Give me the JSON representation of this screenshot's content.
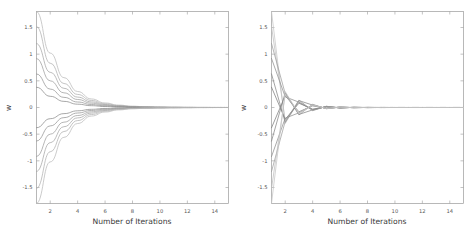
{
  "figure": {
    "background_color": "#ffffff",
    "frame_color": "#9a9a9a",
    "text_color": "#555555"
  },
  "chart_data": [
    {
      "type": "line",
      "title": "",
      "panel_name": "monotonic-convergence",
      "xlabel": "Number of Iterations",
      "ylabel": "w",
      "xlim": [
        1,
        15
      ],
      "ylim": [
        -1.8,
        1.8
      ],
      "xticks": [
        2,
        4,
        6,
        8,
        10,
        12,
        14
      ],
      "xticklabels": [
        "2",
        "4",
        "6",
        "8",
        "10",
        "12",
        "14"
      ],
      "yticks": [
        1.5,
        1,
        0.5,
        0,
        -0.5,
        -1,
        -1.5
      ],
      "yticklabels": [
        "1.5",
        "1",
        "0.5",
        "0",
        "-0.5",
        "-1",
        "-1.5"
      ],
      "grid": false,
      "legend": null,
      "x": [
        1,
        2,
        3,
        4,
        5,
        6,
        7,
        8,
        9,
        10,
        11,
        12,
        13,
        14,
        15
      ],
      "series": [
        {
          "name": "w1",
          "color": "#b9b9b9",
          "values": [
            1.8,
            1.02,
            0.56,
            0.3,
            0.16,
            0.085,
            0.045,
            0.024,
            0.013,
            0.007,
            0.004,
            0.002,
            0.001,
            0.0005,
            0.0003
          ]
        },
        {
          "name": "w2",
          "color": "#b0b0b0",
          "values": [
            1.52,
            0.83,
            0.45,
            0.245,
            0.132,
            0.07,
            0.037,
            0.02,
            0.011,
            0.006,
            0.003,
            0.0017,
            0.0009,
            0.0005,
            0.0002
          ]
        },
        {
          "name": "w3",
          "color": "#a6a6a6",
          "values": [
            1.2,
            0.66,
            0.36,
            0.195,
            0.105,
            0.056,
            0.03,
            0.016,
            0.0085,
            0.0045,
            0.0024,
            0.0013,
            0.0007,
            0.0004,
            0.0002
          ]
        },
        {
          "name": "w4",
          "color": "#9d9d9d",
          "values": [
            0.92,
            0.5,
            0.275,
            0.15,
            0.081,
            0.043,
            0.023,
            0.012,
            0.0065,
            0.0035,
            0.0019,
            0.001,
            0.0005,
            0.0003,
            0.0001
          ]
        },
        {
          "name": "w5",
          "color": "#949494",
          "values": [
            0.63,
            0.345,
            0.19,
            0.103,
            0.056,
            0.03,
            0.016,
            0.0085,
            0.0045,
            0.0024,
            0.0013,
            0.0007,
            0.0004,
            0.0002,
            0.0001
          ]
        },
        {
          "name": "w6",
          "color": "#8b8b8b",
          "values": [
            0.38,
            0.21,
            0.115,
            0.062,
            0.034,
            0.018,
            0.0096,
            0.0051,
            0.0027,
            0.0015,
            0.0008,
            0.0004,
            0.0002,
            0.0001,
            5e-05
          ]
        },
        {
          "name": "w7",
          "color": "#8b8b8b",
          "values": [
            -0.38,
            -0.21,
            -0.115,
            -0.062,
            -0.034,
            -0.018,
            -0.0096,
            -0.0051,
            -0.0027,
            -0.0015,
            -0.0008,
            -0.0004,
            -0.0002,
            -0.0001,
            -5e-05
          ]
        },
        {
          "name": "w8",
          "color": "#949494",
          "values": [
            -0.63,
            -0.345,
            -0.19,
            -0.103,
            -0.056,
            -0.03,
            -0.016,
            -0.0085,
            -0.0045,
            -0.0024,
            -0.0013,
            -0.0007,
            -0.0004,
            -0.0002,
            -0.0001
          ]
        },
        {
          "name": "w9",
          "color": "#9d9d9d",
          "values": [
            -0.92,
            -0.5,
            -0.275,
            -0.15,
            -0.081,
            -0.043,
            -0.023,
            -0.012,
            -0.0065,
            -0.0035,
            -0.0019,
            -0.001,
            -0.0005,
            -0.0003,
            -0.0001
          ]
        },
        {
          "name": "w10",
          "color": "#a6a6a6",
          "values": [
            -1.2,
            -0.66,
            -0.36,
            -0.195,
            -0.105,
            -0.056,
            -0.03,
            -0.016,
            -0.0085,
            -0.0045,
            -0.0024,
            -0.0013,
            -0.0007,
            -0.0004,
            -0.0002
          ]
        },
        {
          "name": "w11",
          "color": "#b0b0b0",
          "values": [
            -1.52,
            -0.83,
            -0.45,
            -0.245,
            -0.132,
            -0.07,
            -0.037,
            -0.02,
            -0.011,
            -0.006,
            -0.003,
            -0.0017,
            -0.0009,
            -0.0005,
            -0.0002
          ]
        },
        {
          "name": "w12",
          "color": "#b9b9b9",
          "values": [
            -1.8,
            -1.02,
            -0.56,
            -0.3,
            -0.16,
            -0.085,
            -0.045,
            -0.024,
            -0.013,
            -0.007,
            -0.004,
            -0.002,
            -0.001,
            -0.0005,
            -0.0003
          ]
        }
      ]
    },
    {
      "type": "line",
      "title": "",
      "panel_name": "oscillatory-convergence",
      "xlabel": "Number of Iterations",
      "ylabel": "w",
      "xlim": [
        1,
        15
      ],
      "ylim": [
        -1.8,
        1.8
      ],
      "xticks": [
        2,
        4,
        6,
        8,
        10,
        12,
        14
      ],
      "xticklabels": [
        "2",
        "4",
        "6",
        "8",
        "10",
        "12",
        "14"
      ],
      "yticks": [
        1.5,
        1,
        0.5,
        0,
        -0.5,
        -1,
        -1.5
      ],
      "yticklabels": [
        "1.5",
        "1",
        "0.5",
        "0",
        "-0.5",
        "-1",
        "-1.5"
      ],
      "grid": false,
      "legend": null,
      "x": [
        1,
        2,
        3,
        4,
        5,
        6,
        7,
        8,
        9,
        10,
        11,
        12,
        13,
        14,
        15
      ],
      "series": [
        {
          "name": "w1",
          "color": "#c6c6c6",
          "values": [
            1.8,
            -0.3,
            0.12,
            -0.05,
            0.02,
            -0.008,
            0.003,
            -0.0012,
            0.0005,
            -0.0002,
            0.0001,
            -4e-05,
            2e-05,
            -1e-05,
            3e-06
          ]
        },
        {
          "name": "w2",
          "color": "#bdbdbd",
          "values": [
            1.52,
            -0.24,
            0.095,
            -0.038,
            0.015,
            -0.006,
            0.0024,
            -0.001,
            0.0004,
            -0.00016,
            6e-05,
            -3e-05,
            1e-05,
            -5e-06,
            2e-06
          ]
        },
        {
          "name": "w3",
          "color": "#9e9e9e",
          "values": [
            1.2,
            0.26,
            -0.14,
            0.06,
            -0.024,
            0.0095,
            -0.0038,
            0.0015,
            -0.0006,
            0.00024,
            -0.0001,
            4e-05,
            -1.5e-05,
            6e-06,
            -2e-06
          ]
        },
        {
          "name": "w4",
          "color": "#8f8f8f",
          "values": [
            0.92,
            0.2,
            0.1,
            -0.05,
            0.02,
            -0.008,
            0.0032,
            -0.0013,
            0.0005,
            -0.0002,
            8e-05,
            -3e-05,
            1e-05,
            -5e-06,
            2e-06
          ]
        },
        {
          "name": "w5",
          "color": "#868686",
          "values": [
            0.63,
            -0.28,
            0.13,
            0.045,
            -0.018,
            0.007,
            -0.003,
            0.0012,
            -0.0005,
            0.0002,
            -8e-05,
            3e-05,
            -1e-05,
            4e-06,
            -2e-06
          ]
        },
        {
          "name": "w6",
          "color": "#7d7d7d",
          "values": [
            0.38,
            -0.22,
            0.08,
            -0.03,
            0.012,
            -0.005,
            0.002,
            -0.0008,
            0.0003,
            -0.00012,
            5e-05,
            -2e-05,
            8e-06,
            -3e-06,
            1e-06
          ]
        },
        {
          "name": "w7",
          "color": "#7d7d7d",
          "values": [
            -0.38,
            0.22,
            -0.08,
            0.03,
            -0.012,
            0.005,
            -0.002,
            0.0008,
            -0.0003,
            0.00012,
            -5e-05,
            2e-05,
            -8e-06,
            3e-06,
            -1e-06
          ]
        },
        {
          "name": "w8",
          "color": "#868686",
          "values": [
            -0.63,
            0.28,
            -0.13,
            -0.045,
            0.018,
            -0.007,
            0.003,
            -0.0012,
            0.0005,
            -0.0002,
            8e-05,
            -3e-05,
            1e-05,
            -4e-06,
            2e-06
          ]
        },
        {
          "name": "w9",
          "color": "#8f8f8f",
          "values": [
            -0.92,
            -0.2,
            -0.1,
            0.05,
            -0.02,
            0.008,
            -0.0032,
            0.0013,
            -0.0005,
            0.0002,
            -8e-05,
            3e-05,
            -1e-05,
            5e-06,
            -2e-06
          ]
        },
        {
          "name": "w10",
          "color": "#9e9e9e",
          "values": [
            -1.2,
            -0.26,
            0.14,
            -0.06,
            0.024,
            -0.0095,
            0.0038,
            -0.0015,
            0.0006,
            -0.00024,
            0.0001,
            -4e-05,
            1.5e-05,
            -6e-06,
            2e-06
          ]
        },
        {
          "name": "w11",
          "color": "#bdbdbd",
          "values": [
            -1.52,
            0.24,
            -0.095,
            0.038,
            -0.015,
            0.006,
            -0.0024,
            0.001,
            -0.0004,
            0.00016,
            -6e-05,
            3e-05,
            -1e-05,
            5e-06,
            -2e-06
          ]
        },
        {
          "name": "w12",
          "color": "#c6c6c6",
          "values": [
            -1.8,
            0.3,
            -0.12,
            0.05,
            -0.02,
            0.008,
            -0.003,
            0.0012,
            -0.0005,
            0.0002,
            -0.0001,
            4e-05,
            -2e-05,
            1e-05,
            -3e-06
          ]
        }
      ]
    }
  ]
}
